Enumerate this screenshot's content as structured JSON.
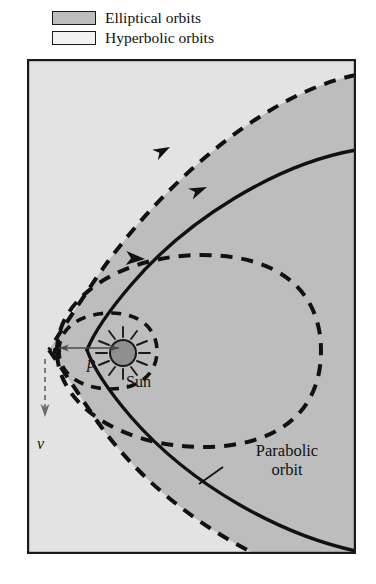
{
  "figure": {
    "name": "orbit-types-diagram",
    "legend": {
      "items": [
        {
          "label": "Elliptical orbits",
          "swatch_color": "#bdbdbd",
          "swatch_name": "elliptical-orbits-swatch"
        },
        {
          "label": "Hyperbolic orbits",
          "swatch_color": "#f2f2f2",
          "swatch_name": "hyperbolic-orbits-swatch"
        }
      ]
    },
    "annotations": {
      "sun_label": "Sun",
      "perihelion_label": "p",
      "velocity_label": "v",
      "parabolic_label_line1": "Parabolic",
      "parabolic_label_line2": "orbit"
    },
    "colors": {
      "elliptical_region": "#bdbdbd",
      "hyperbolic_region": "#e3e3e3",
      "curve_stroke": "#111111",
      "frame_stroke": "#1a1a1a",
      "sun_fill": "#8f8f8f",
      "background": "#ffffff"
    },
    "curves": [
      {
        "name": "parabolic-orbit",
        "style": "solid",
        "description": "Parabolic orbit solid curve opening to the right from perihelion"
      },
      {
        "name": "hyperbolic-orbit",
        "style": "dashed",
        "description": "Hyperbolic orbit dashed curve, wider opening than parabola"
      },
      {
        "name": "elliptical-orbit-large",
        "style": "dashed",
        "description": "Large dashed ellipse with perihelion at left focus point"
      },
      {
        "name": "elliptical-orbit-small",
        "style": "dashed",
        "description": "Small dashed ellipse enclosing the Sun"
      }
    ],
    "markers": {
      "sun_name": "sun-symbol",
      "perihelion_point_name": "perihelion-point",
      "velocity_arrow_name": "velocity-arrow",
      "perihelion_distance_arrow_name": "perihelion-distance-arrow",
      "direction_arrow_names": [
        "hyperbola-direction-arrow",
        "parabola-direction-arrow",
        "ellipse-direction-arrow"
      ]
    }
  }
}
